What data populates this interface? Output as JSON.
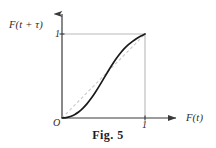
{
  "figure": {
    "caption": "Fig. 5",
    "axes": {
      "y_label": "F(t + τ)",
      "x_label": "F(t)",
      "origin_label": "O",
      "y_tick_label": "1",
      "x_tick_label": "1"
    },
    "colors": {
      "background": "#ffffff",
      "axis": "#3a3a3a",
      "box": "#b9b9b9",
      "curve": "#1a1a1a",
      "diagonal": "#c9c9c9",
      "text": "#2a2a2a"
    }
  },
  "chart_data": {
    "type": "line",
    "title": "Fig. 5",
    "xlabel": "F(t)",
    "ylabel": "F(t + τ)",
    "xlim": [
      0,
      1
    ],
    "ylim": [
      0,
      1
    ],
    "xticks": [
      0,
      1
    ],
    "yticks": [
      1
    ],
    "xticklabels": [
      "O",
      "1"
    ],
    "yticklabels": [
      "1"
    ],
    "grid": false,
    "legend": null,
    "series": [
      {
        "name": "copula diagonal section",
        "style": "solid",
        "color": "#1a1a1a",
        "x": [
          0.0,
          0.05,
          0.1,
          0.15,
          0.2,
          0.25,
          0.3,
          0.35,
          0.4,
          0.45,
          0.5,
          0.55,
          0.6,
          0.65,
          0.7,
          0.75,
          0.8,
          0.85,
          0.9,
          0.95,
          1.0
        ],
        "y": [
          0.0,
          0.005,
          0.018,
          0.04,
          0.072,
          0.115,
          0.168,
          0.231,
          0.303,
          0.382,
          0.465,
          0.548,
          0.628,
          0.702,
          0.768,
          0.825,
          0.873,
          0.913,
          0.947,
          0.976,
          1.0
        ]
      },
      {
        "name": "identity reference line",
        "style": "dashed",
        "color": "#c9c9c9",
        "x": [
          0,
          1
        ],
        "y": [
          0,
          1
        ]
      }
    ],
    "annotations": [
      {
        "text": "curve lies below the diagonal for F(t) < 0.5"
      },
      {
        "text": "curve lies above the diagonal for F(t) > 0.5"
      },
      {
        "text": "endpoints fixed at (0,0) and (1,1)"
      }
    ]
  }
}
